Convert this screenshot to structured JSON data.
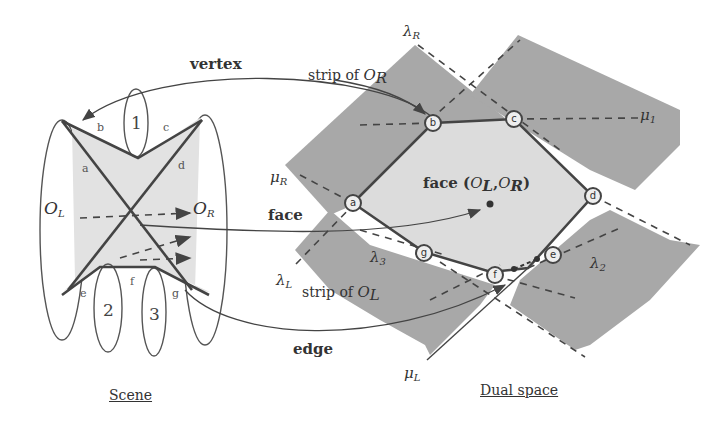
{
  "labels": {
    "vertex": "vertex",
    "face": "face",
    "edge": "edge",
    "strip_or": "strip of ",
    "strip_ol": "strip of ",
    "face_center": "face (",
    "face_center_close": ")",
    "OL": "O",
    "OR": "O",
    "sub_L": "L",
    "sub_R": "R",
    "comma": ",",
    "lambda": "λ",
    "mu": "μ",
    "lambda_R_sub": "R",
    "lambda_L_sub": "L",
    "lambda_3_sub": "3",
    "lambda_2_sub": "2",
    "mu_R_sub": "R",
    "mu_L_sub": "L",
    "mu_1_sub": "1"
  },
  "scene": {
    "caption": "Scene",
    "edge_labels": [
      "a",
      "b",
      "c",
      "d",
      "e",
      "f",
      "g"
    ],
    "objects": [
      "1",
      "2",
      "3"
    ]
  },
  "dual": {
    "caption": "Dual space",
    "vertices": [
      "a",
      "b",
      "c",
      "d",
      "e",
      "f",
      "g"
    ]
  }
}
